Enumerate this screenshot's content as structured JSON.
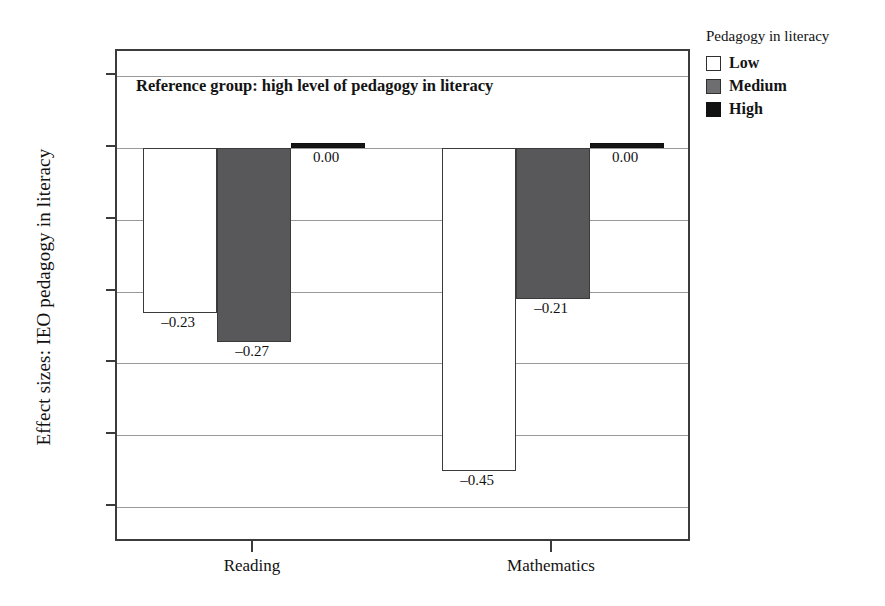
{
  "chart_data": {
    "type": "bar",
    "title": "",
    "subtitle": "",
    "xlabel": "",
    "ylabel": "Effect sizes: IEO pedagogy in literacy",
    "categories": [
      "Reading",
      "Mathematics"
    ],
    "series": [
      {
        "name": "Low",
        "color": "#ffffff",
        "values": [
          -0.23,
          -0.45
        ],
        "labels": [
          "–0.23",
          "–0.45"
        ]
      },
      {
        "name": "Medium",
        "color": "#58585a",
        "values": [
          -0.27,
          -0.21
        ],
        "labels": [
          "–0.27",
          "–0.21"
        ]
      },
      {
        "name": "High",
        "color": "#151515",
        "values": [
          0.0,
          0.0
        ],
        "labels": [
          "0.00",
          "0.00"
        ]
      }
    ],
    "ylim": [
      -0.55,
      0.135
    ],
    "yticks": [
      0.1,
      0.0,
      -0.1,
      -0.2,
      -0.3,
      -0.4,
      -0.5
    ],
    "ytick_labels": [
      "0.10",
      "0.00",
      "–0.10",
      "–0.20",
      "–0.30",
      "–0.40",
      "–0.50"
    ],
    "grid": true,
    "legend_position": "right",
    "annotation": "Reference group: high level of pedagogy in literacy"
  },
  "legend": {
    "title": "Pedagogy in literacy",
    "items": [
      {
        "label": "Low",
        "swatch": "low-swatch"
      },
      {
        "label": "Medium",
        "swatch": "medium-swatch"
      },
      {
        "label": "High",
        "swatch": "high-swatch"
      }
    ]
  },
  "colors": {
    "low": "#ffffff",
    "medium": "#58585a",
    "high": "#151515",
    "frame": "#3b3b3b",
    "gridline": "#9a9a9a",
    "text": "#111111"
  }
}
